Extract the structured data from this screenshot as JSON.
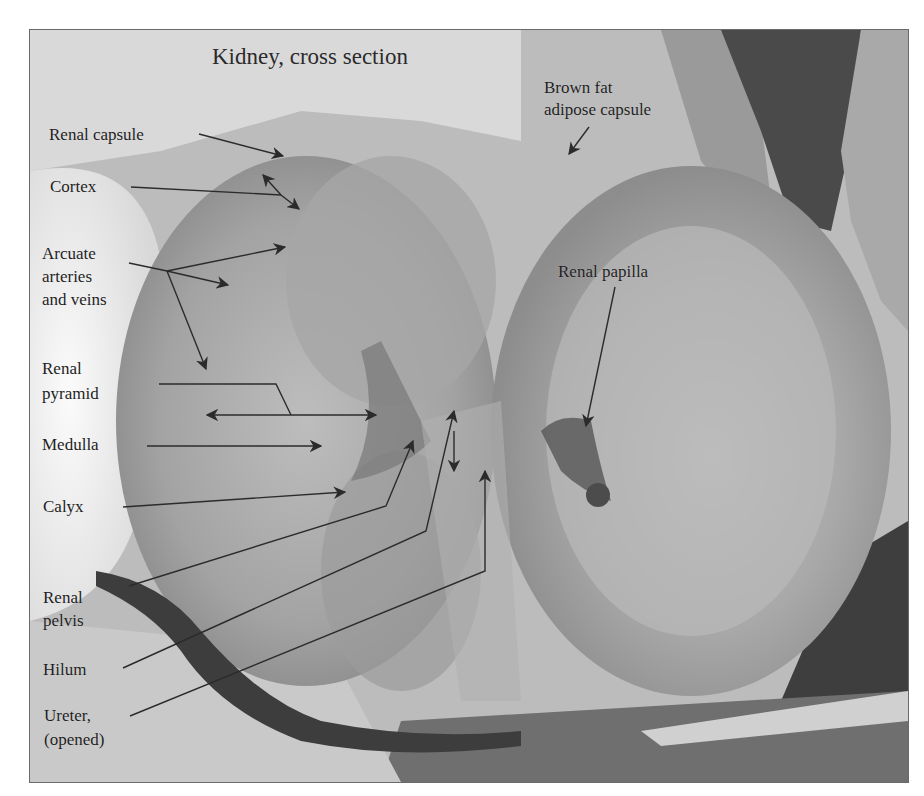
{
  "title": "Kidney, cross section",
  "labels": {
    "renal_capsule": "Renal capsule",
    "cortex": "Cortex",
    "arcuate_1": "Arcuate",
    "arcuate_2": "arteries",
    "arcuate_3": "and veins",
    "renal_pyramid_1": "Renal",
    "renal_pyramid_2": "pyramid",
    "medulla": "Medulla",
    "calyx": "Calyx",
    "renal_pelvis_1": "Renal",
    "renal_pelvis_2": "pelvis",
    "hilum": "Hilum",
    "ureter_1": "Ureter,",
    "ureter_2": "(opened)",
    "brown_fat_1": "Brown fat",
    "brown_fat_2": "adipose capsule",
    "renal_papilla": "Renal papilla"
  },
  "colors": {
    "frame_border": "#6a6a6a",
    "label_text": "#1e1e1e",
    "arrow": "#2b2b2b"
  }
}
